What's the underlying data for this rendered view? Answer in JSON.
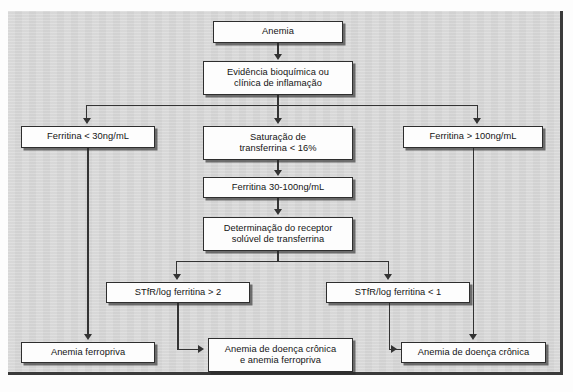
{
  "diagram": {
    "language": "pt-BR",
    "panel_color": "#d8d8d8",
    "box_fill": "#fdfdfd",
    "line_color": "#333333",
    "nodes": {
      "anemia": "Anemia",
      "evidencia_l1": "Evidência bioquímica ou",
      "evidencia_l2": "clínica de inflamação",
      "ferritina_baixa": "Ferritina < 30ng/mL",
      "saturacao_l1": "Saturação de",
      "saturacao_l2": "transferrina < 16%",
      "ferritina_alta": "Ferritina > 100ng/mL",
      "ferritina_media": "Ferritina 30-100ng/mL",
      "receptor_l1": "Determinação do receptor",
      "receptor_l2": "solúvel de transferrina",
      "stfr_maior": "STfR/log ferritina > 2",
      "stfr_menor": "STfR/log ferritina < 1",
      "anemia_ferropriva": "Anemia ferropriva",
      "anemia_mista_l1": "Anemia de doença crônica",
      "anemia_mista_l2": "e anemia ferropriva",
      "anemia_cronica": "Anemia de doença crônica"
    },
    "caption": ""
  }
}
